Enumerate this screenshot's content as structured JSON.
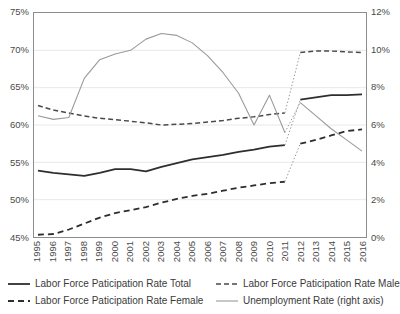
{
  "chart_data": {
    "type": "line",
    "title": "",
    "xlabel": "",
    "ylabel": "",
    "categories": [
      "1995",
      "1996",
      "1997",
      "1998",
      "1999",
      "2000",
      "2001",
      "2002",
      "2003",
      "2004",
      "2005",
      "2006",
      "2007",
      "2008",
      "2009",
      "2010",
      "2011",
      "2012",
      "2013",
      "2014",
      "2015",
      "2016"
    ],
    "left_axis": {
      "label": "",
      "ylim": [
        45,
        75
      ],
      "ticks": [
        "45%",
        "50%",
        "55%",
        "60%",
        "65%",
        "70%",
        "75%"
      ],
      "tick_values": [
        45,
        50,
        55,
        60,
        65,
        70,
        75
      ]
    },
    "right_axis": {
      "label": "right axis",
      "ylim": [
        0,
        12
      ],
      "ticks": [
        "0%",
        "2%",
        "4%",
        "6%",
        "8%",
        "10%",
        "12%"
      ],
      "tick_values": [
        0,
        2,
        4,
        6,
        8,
        10,
        12
      ]
    },
    "grid": true,
    "legend_position": "bottom",
    "series_break_after": "2011",
    "series": [
      {
        "name": "Labor Force Paticipation Rate  Total",
        "axis": "left",
        "style": "solid",
        "color": "#2e2e2e",
        "width": 1.8,
        "values": [
          53.9,
          53.6,
          53.4,
          53.2,
          53.6,
          54.1,
          54.1,
          53.8,
          54.4,
          54.9,
          55.4,
          55.7,
          56.0,
          56.4,
          56.7,
          57.1,
          57.3,
          63.4,
          63.7,
          64.0,
          64.0,
          64.1
        ]
      },
      {
        "name": "Labor Force Paticipation Rate  Male",
        "axis": "left",
        "style": "dashed",
        "color": "#4a4a4a",
        "width": 1.5,
        "values": [
          62.6,
          62.0,
          61.6,
          61.2,
          60.9,
          60.7,
          60.5,
          60.3,
          60.0,
          60.1,
          60.2,
          60.4,
          60.6,
          60.9,
          61.1,
          61.4,
          61.6,
          69.7,
          69.9,
          69.9,
          69.8,
          69.7
        ]
      },
      {
        "name": "Labor Force Paticipation Rate  Female",
        "axis": "left",
        "style": "dashed",
        "color": "#2e2e2e",
        "width": 1.8,
        "values": [
          45.3,
          45.4,
          46.0,
          46.8,
          47.6,
          48.2,
          48.6,
          49.0,
          49.6,
          50.1,
          50.5,
          50.8,
          51.2,
          51.6,
          51.9,
          52.2,
          52.4,
          57.5,
          58.0,
          58.6,
          59.2,
          59.4
        ]
      },
      {
        "name": "Unemployment Rate (right axis)",
        "axis": "right",
        "style": "solid",
        "color": "#9a9a9a",
        "width": 1.1,
        "values": [
          6.5,
          6.3,
          6.4,
          8.5,
          9.5,
          9.8,
          10.0,
          10.6,
          10.9,
          10.8,
          10.4,
          9.7,
          8.8,
          7.7,
          6.0,
          7.6,
          5.6,
          7.2,
          6.5,
          5.8,
          5.2,
          4.6
        ]
      }
    ]
  },
  "legend": {
    "items": [
      {
        "label": "Labor Force Paticipation Rate  Total",
        "style": "solid",
        "color": "#2e2e2e",
        "width": 1.8
      },
      {
        "label": "Labor Force Paticipation Rate  Male",
        "style": "dashed",
        "color": "#4a4a4a",
        "width": 1.5
      },
      {
        "label": "Labor Force Paticipation Rate  Female",
        "style": "dashed",
        "color": "#2e2e2e",
        "width": 1.8
      },
      {
        "label": "Unemployment Rate (right axis)",
        "style": "solid",
        "color": "#9a9a9a",
        "width": 1.1
      }
    ]
  },
  "colors": {
    "grid": "#e8e8e8",
    "frame": "#8c8c8c",
    "text": "#3a3a3a",
    "break_marker": "#9a9a9a"
  }
}
